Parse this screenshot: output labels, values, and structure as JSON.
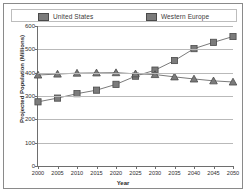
{
  "chart_data": {
    "type": "line",
    "title": "",
    "xlabel": "Year",
    "ylabel": "Projected Population (Millions)",
    "categories": [
      2000,
      2005,
      2010,
      2015,
      2020,
      2025,
      2030,
      2035,
      2040,
      2045,
      2050
    ],
    "xlim": [
      2000,
      2050
    ],
    "ylim": [
      0,
      600
    ],
    "yticks": [
      0,
      100,
      200,
      300,
      400,
      500,
      600
    ],
    "xticks": [
      "2000",
      "2005",
      "2010",
      "2015",
      "2020",
      "2025",
      "2030",
      "2035",
      "2040",
      "2045",
      "2050"
    ],
    "grid": "horizontal",
    "legend_position": "top",
    "series": [
      {
        "name": "United States",
        "marker": "square",
        "color": "#7b7b7b",
        "values": [
          275,
          291,
          310,
          325,
          350,
          385,
          411,
          452,
          503,
          530,
          555
        ]
      },
      {
        "name": "Western Europe",
        "marker": "triangle",
        "color": "#7b7b7b",
        "values": [
          390,
          394,
          398,
          399,
          400,
          395,
          392,
          382,
          373,
          365,
          360
        ]
      }
    ]
  },
  "legend": {
    "items": [
      {
        "label": "United States"
      },
      {
        "label": "Western Europe"
      }
    ]
  },
  "colors": {
    "series": "#7b7b7b",
    "marker_edge": "#4a4a4a",
    "gridline": "#b9b9b9",
    "axis": "#6e6e6e",
    "frame": "#8a8a8a",
    "text": "#2f2f2f"
  }
}
